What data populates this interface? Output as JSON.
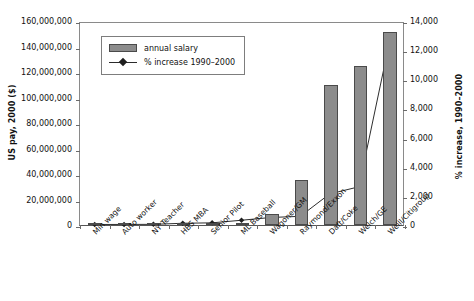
{
  "chart_data": {
    "type": "bar",
    "title": "",
    "categories": [
      "Min wage",
      "Auto worker",
      "NY Teacher",
      "HBS MBA",
      "Senior Pilot",
      "ML Baseball",
      "Wagoner/GM",
      "Raymond/Exxon",
      "Daft/Coke",
      "Welch/GE",
      "Weill/Citigroup"
    ],
    "series": [
      {
        "name": "annual salary",
        "type": "bar",
        "axis": "left",
        "values": [
          10000,
          50000,
          55000,
          130000,
          250000,
          1900000,
          8500000,
          35000000,
          110000000,
          125000000,
          151000000
        ]
      },
      {
        "name": "% increase 1990–2000",
        "type": "line",
        "axis": "right",
        "values": [
          35,
          40,
          45,
          120,
          150,
          330,
          520,
          600,
          2150,
          2650,
          12300
        ]
      }
    ],
    "xlabel": "",
    "ylabel": "US pay, 2000 ($)",
    "y2label": "% increase, 1990–2000",
    "ylim": [
      0,
      160000000
    ],
    "y2lim": [
      0,
      14000
    ],
    "yticks": [
      "0",
      "20,000,000",
      "40,000,000",
      "60,000,000",
      "80,000,000",
      "100,000,000",
      "120,000,000",
      "140,000,000",
      "160,000,000"
    ],
    "y2ticks": [
      "0",
      "2,000",
      "4,000",
      "6,000",
      "8,000",
      "10,000",
      "12,000",
      "14,000"
    ],
    "grid": false,
    "legend_position": "top-left",
    "legend": [
      "annual salary",
      "% increase 1990–2000"
    ],
    "colors": {
      "bar_fill": "#8c8c8c",
      "bar_edge": "#4a4a4a",
      "line": "#2b2b2b",
      "marker": "#1f1f1f",
      "axis": "#555555",
      "text": "#111111",
      "background": "#ffffff"
    }
  }
}
